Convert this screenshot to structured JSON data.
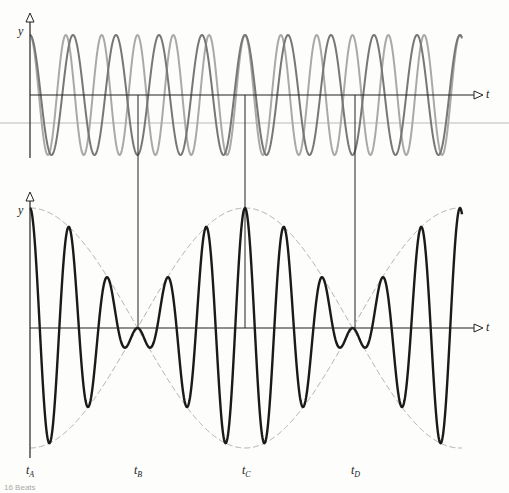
{
  "figure": {
    "top_panel": {
      "y_label": "y",
      "t_label": "t",
      "description": "Two superposed sinusoids of slightly different frequency"
    },
    "bottom_panel": {
      "y_label": "y",
      "t_label": "t",
      "description": "Resultant beat waveform with dashed envelope"
    },
    "time_markers": [
      {
        "label": "t",
        "sub": "A"
      },
      {
        "label": "t",
        "sub": "B"
      },
      {
        "label": "t",
        "sub": "C"
      },
      {
        "label": "t",
        "sub": "D"
      }
    ],
    "caption": "16  Beats"
  },
  "colors": {
    "wave1": "#a9a9a9",
    "wave2": "#777777",
    "resultant": "#1a1a1a",
    "envelope": "#aaaaaa",
    "axis": "#222222"
  }
}
